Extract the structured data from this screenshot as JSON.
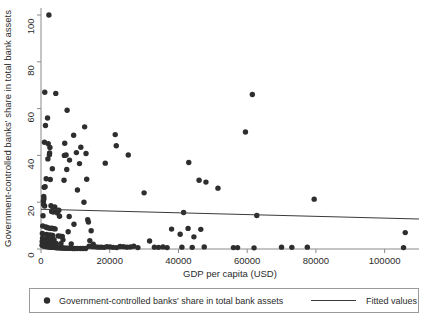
{
  "chart_data": {
    "type": "scatter",
    "title": "",
    "xlabel": "GDP per capita (USD)",
    "ylabel": "Government-controlled banks' share in total bank assets",
    "xlim": [
      0,
      110000
    ],
    "ylim": [
      0,
      103
    ],
    "xticks": [
      0,
      20000,
      40000,
      60000,
      80000,
      100000
    ],
    "xtick_labels": [
      "0",
      "20000",
      "40000",
      "60000",
      "80000",
      "100000"
    ],
    "yticks": [
      0,
      20,
      40,
      60,
      80,
      100
    ],
    "ytick_labels": [
      "0",
      "20",
      "40",
      "60",
      "80",
      "100"
    ],
    "grid": false,
    "legend_position": "bottom",
    "marker_color": "#2e2e2e",
    "line_color": "#3a3a3a",
    "series": [
      {
        "name": "Government-controlled banks' share in total bank assets",
        "type": "scatter",
        "points": [
          [
            2300,
            100.0
          ],
          [
            1100,
            67.0
          ],
          [
            4300,
            66.5
          ],
          [
            61500,
            66.0
          ],
          [
            7600,
            59.3
          ],
          [
            59500,
            50.0
          ],
          [
            1900,
            56.0
          ],
          [
            1300,
            52.8
          ],
          [
            12700,
            52.2
          ],
          [
            21600,
            48.9
          ],
          [
            9500,
            48.6
          ],
          [
            1000,
            45.6
          ],
          [
            2100,
            45.0
          ],
          [
            6900,
            45.2
          ],
          [
            2600,
            43.4
          ],
          [
            11600,
            43.5
          ],
          [
            21900,
            44.1
          ],
          [
            2500,
            41.0
          ],
          [
            2450,
            40.3
          ],
          [
            6800,
            40.0
          ],
          [
            7300,
            40.2
          ],
          [
            10300,
            41.2
          ],
          [
            13100,
            40.8
          ],
          [
            25400,
            40.2
          ],
          [
            2000,
            38.5
          ],
          [
            8300,
            38.0
          ],
          [
            43000,
            37.0
          ],
          [
            11200,
            36.5
          ],
          [
            18700,
            36.7
          ],
          [
            3300,
            34.3
          ],
          [
            7500,
            34.0
          ],
          [
            1500,
            30.0
          ],
          [
            2700,
            29.7
          ],
          [
            6700,
            29.4
          ],
          [
            13300,
            29.8
          ],
          [
            46000,
            29.4
          ],
          [
            48000,
            28.6
          ],
          [
            1200,
            26.6
          ],
          [
            900,
            26.4
          ],
          [
            51500,
            26.0
          ],
          [
            10600,
            25.2
          ],
          [
            30000,
            24.0
          ],
          [
            800,
            22.5
          ],
          [
            850,
            21.5
          ],
          [
            79500,
            21.3
          ],
          [
            700,
            20.5
          ],
          [
            12500,
            20.0
          ],
          [
            750,
            19.0
          ],
          [
            1050,
            18.4
          ],
          [
            2900,
            18.5
          ],
          [
            4000,
            18.0
          ],
          [
            3500,
            17.5
          ],
          [
            3900,
            17.2
          ],
          [
            4200,
            16.8
          ],
          [
            4600,
            16.5
          ],
          [
            5200,
            16.6
          ],
          [
            3100,
            16.0
          ],
          [
            3600,
            15.8
          ],
          [
            4800,
            15.4
          ],
          [
            41500,
            15.6
          ],
          [
            62800,
            14.3
          ],
          [
            600,
            14.2
          ],
          [
            5400,
            14.0
          ],
          [
            8200,
            13.9
          ],
          [
            13600,
            12.5
          ],
          [
            13800,
            11.5
          ],
          [
            9600,
            10.6
          ],
          [
            500,
            9.8
          ],
          [
            1400,
            9.4
          ],
          [
            1700,
            9.2
          ],
          [
            2200,
            9.0
          ],
          [
            2800,
            8.8
          ],
          [
            3200,
            8.9
          ],
          [
            3700,
            8.7
          ],
          [
            4100,
            8.6
          ],
          [
            42800,
            8.8
          ],
          [
            38000,
            8.5
          ],
          [
            46500,
            8.4
          ],
          [
            14600,
            7.8
          ],
          [
            7900,
            7.4
          ],
          [
            106000,
            7.0
          ],
          [
            400,
            6.6
          ],
          [
            1600,
            6.2
          ],
          [
            2400,
            6.0
          ],
          [
            3000,
            5.9
          ],
          [
            3400,
            5.8
          ],
          [
            5000,
            5.6
          ],
          [
            5600,
            5.5
          ],
          [
            6200,
            5.4
          ],
          [
            40500,
            6.3
          ],
          [
            44500,
            5.2
          ],
          [
            450,
            4.6
          ],
          [
            1800,
            4.4
          ],
          [
            2050,
            4.2
          ],
          [
            2950,
            4.1
          ],
          [
            3800,
            4.0
          ],
          [
            6400,
            3.9
          ],
          [
            14200,
            3.6
          ],
          [
            31600,
            3.4
          ],
          [
            350,
            3.2
          ],
          [
            950,
            3.0
          ],
          [
            1250,
            2.9
          ],
          [
            1550,
            2.8
          ],
          [
            2150,
            2.7
          ],
          [
            2650,
            2.6
          ],
          [
            3050,
            2.5
          ],
          [
            4400,
            2.4
          ],
          [
            5800,
            2.3
          ],
          [
            8800,
            2.2
          ],
          [
            15200,
            2.1
          ],
          [
            300,
            1.6
          ],
          [
            550,
            1.5
          ],
          [
            700,
            1.4
          ],
          [
            880,
            1.3
          ],
          [
            1150,
            1.2
          ],
          [
            1350,
            1.1
          ],
          [
            1650,
            1.0
          ],
          [
            1950,
            1.0
          ],
          [
            2250,
            0.9
          ],
          [
            2550,
            0.9
          ],
          [
            2850,
            0.8
          ],
          [
            3150,
            0.8
          ],
          [
            3450,
            0.7
          ],
          [
            3750,
            0.7
          ],
          [
            4050,
            0.6
          ],
          [
            4350,
            0.6
          ],
          [
            4650,
            0.5
          ],
          [
            4950,
            0.5
          ],
          [
            5350,
            0.5
          ],
          [
            5750,
            0.4
          ],
          [
            6150,
            0.4
          ],
          [
            6550,
            0.4
          ],
          [
            7050,
            0.3
          ],
          [
            7550,
            0.3
          ],
          [
            8050,
            0.3
          ],
          [
            8600,
            0.3
          ],
          [
            9200,
            0.2
          ],
          [
            9800,
            0.2
          ],
          [
            10500,
            0.2
          ],
          [
            11400,
            0.2
          ],
          [
            12200,
            0.2
          ],
          [
            13000,
            0.2
          ],
          [
            14000,
            1.2
          ],
          [
            15000,
            1.0
          ],
          [
            16000,
            0.9
          ],
          [
            16800,
            0.8
          ],
          [
            17600,
            0.8
          ],
          [
            18400,
            0.7
          ],
          [
            19200,
            1.0
          ],
          [
            20100,
            0.9
          ],
          [
            21000,
            0.7
          ],
          [
            22000,
            0.6
          ],
          [
            23000,
            1.1
          ],
          [
            24000,
            1.0
          ],
          [
            25000,
            0.8
          ],
          [
            26000,
            0.9
          ],
          [
            27000,
            1.2
          ],
          [
            28200,
            0.6
          ],
          [
            33000,
            0.8
          ],
          [
            34200,
            0.7
          ],
          [
            35500,
            0.9
          ],
          [
            36700,
            0.6
          ],
          [
            41000,
            0.8
          ],
          [
            44000,
            0.7
          ],
          [
            47500,
            0.9
          ],
          [
            56000,
            0.6
          ],
          [
            57200,
            0.6
          ],
          [
            62000,
            0.5
          ],
          [
            70000,
            0.8
          ],
          [
            73000,
            0.7
          ],
          [
            77500,
            0.8
          ],
          [
            105500,
            0.6
          ]
        ]
      },
      {
        "name": "Fitted values",
        "type": "line",
        "points": [
          [
            0,
            17.0
          ],
          [
            110000,
            12.8
          ]
        ]
      }
    ]
  },
  "legend": {
    "entries": [
      {
        "marker": "dot",
        "label": "Government-controlled banks' share in total bank assets"
      },
      {
        "marker": "line",
        "label": "Fitted values"
      }
    ]
  }
}
